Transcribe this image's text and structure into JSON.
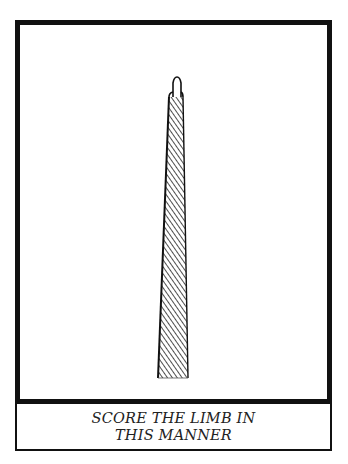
{
  "illustration": {
    "subject": "tapered limb with scoring lines",
    "caption_line1": "SCORE THE LIMB IN",
    "caption_line2": "THIS MANNER"
  },
  "colors": {
    "ink": "#111111",
    "paper": "#ffffff"
  }
}
